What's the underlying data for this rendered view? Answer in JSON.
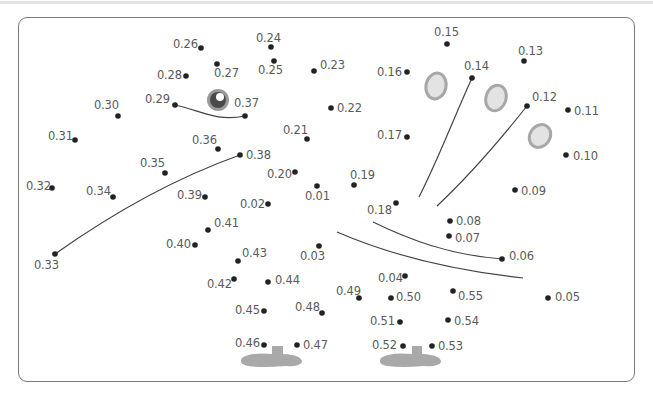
{
  "page": {
    "header_strip": "cropped-text-line"
  },
  "puzzle": {
    "type": "connect-the-dots",
    "dot_color": "#222222",
    "line_color": "#444444",
    "shape_fill": "#a9a9a9",
    "eye_color": "#6b6b6b",
    "oval_fill": "#e3e3e3",
    "oval_stroke": "#a8a8a8",
    "points": [
      {
        "label": "0.01",
        "x": 317,
        "y": 186,
        "lx": 305,
        "ly": 191
      },
      {
        "label": "0.02",
        "x": 268,
        "y": 204,
        "lx": 240,
        "ly": 199
      },
      {
        "label": "0.03",
        "x": 319,
        "y": 246,
        "lx": 300,
        "ly": 251
      },
      {
        "label": "0.04",
        "x": 405,
        "y": 276,
        "lx": 378,
        "ly": 273
      },
      {
        "label": "0.05",
        "x": 548,
        "y": 298,
        "lx": 555,
        "ly": 292
      },
      {
        "label": "0.06",
        "x": 502,
        "y": 259,
        "lx": 509,
        "ly": 251
      },
      {
        "label": "0.07",
        "x": 449,
        "y": 236,
        "lx": 455,
        "ly": 233
      },
      {
        "label": "0.08",
        "x": 450,
        "y": 221,
        "lx": 456,
        "ly": 216
      },
      {
        "label": "0.09",
        "x": 515,
        "y": 190,
        "lx": 521,
        "ly": 186
      },
      {
        "label": "0.10",
        "x": 566,
        "y": 155,
        "lx": 573,
        "ly": 151
      },
      {
        "label": "0.11",
        "x": 568,
        "y": 110,
        "lx": 574,
        "ly": 106
      },
      {
        "label": "0.12",
        "x": 527,
        "y": 106,
        "lx": 532,
        "ly": 92
      },
      {
        "label": "0.13",
        "x": 524,
        "y": 61,
        "lx": 518,
        "ly": 46
      },
      {
        "label": "0.14",
        "x": 472,
        "y": 78,
        "lx": 464,
        "ly": 61
      },
      {
        "label": "0.15",
        "x": 447,
        "y": 44,
        "lx": 434,
        "ly": 27
      },
      {
        "label": "0.16",
        "x": 407,
        "y": 72,
        "lx": 377,
        "ly": 67
      },
      {
        "label": "0.17",
        "x": 407,
        "y": 137,
        "lx": 377,
        "ly": 130
      },
      {
        "label": "0.18",
        "x": 396,
        "y": 203,
        "lx": 367,
        "ly": 205
      },
      {
        "label": "0.19",
        "x": 354,
        "y": 185,
        "lx": 350,
        "ly": 170
      },
      {
        "label": "0.20",
        "x": 295,
        "y": 172,
        "lx": 267,
        "ly": 169
      },
      {
        "label": "0.21",
        "x": 307,
        "y": 139,
        "lx": 283,
        "ly": 125
      },
      {
        "label": "0.22",
        "x": 331,
        "y": 108,
        "lx": 337,
        "ly": 103
      },
      {
        "label": "0.23",
        "x": 314,
        "y": 71,
        "lx": 320,
        "ly": 60
      },
      {
        "label": "0.24",
        "x": 271,
        "y": 47,
        "lx": 256,
        "ly": 33
      },
      {
        "label": "0.25",
        "x": 274,
        "y": 61,
        "lx": 258,
        "ly": 65
      },
      {
        "label": "0.26",
        "x": 201,
        "y": 48,
        "lx": 173,
        "ly": 39
      },
      {
        "label": "0.27",
        "x": 217,
        "y": 64,
        "lx": 214,
        "ly": 68
      },
      {
        "label": "0.28",
        "x": 186,
        "y": 76,
        "lx": 157,
        "ly": 70
      },
      {
        "label": "0.29",
        "x": 175,
        "y": 105,
        "lx": 145,
        "ly": 94
      },
      {
        "label": "0.30",
        "x": 118,
        "y": 116,
        "lx": 94,
        "ly": 100
      },
      {
        "label": "0.31",
        "x": 75,
        "y": 140,
        "lx": 48,
        "ly": 131
      },
      {
        "label": "0.32",
        "x": 52,
        "y": 188,
        "lx": 26,
        "ly": 181
      },
      {
        "label": "0.33",
        "x": 55,
        "y": 254,
        "lx": 34,
        "ly": 260
      },
      {
        "label": "0.34",
        "x": 113,
        "y": 197,
        "lx": 86,
        "ly": 186
      },
      {
        "label": "0.35",
        "x": 165,
        "y": 173,
        "lx": 140,
        "ly": 158
      },
      {
        "label": "0.36",
        "x": 218,
        "y": 149,
        "lx": 192,
        "ly": 135
      },
      {
        "label": "0.37",
        "x": 245,
        "y": 116,
        "lx": 234,
        "ly": 98
      },
      {
        "label": "0.38",
        "x": 240,
        "y": 155,
        "lx": 246,
        "ly": 150
      },
      {
        "label": "0.39",
        "x": 205,
        "y": 197,
        "lx": 177,
        "ly": 190
      },
      {
        "label": "0.40",
        "x": 195,
        "y": 245,
        "lx": 166,
        "ly": 239
      },
      {
        "label": "0.41",
        "x": 208,
        "y": 230,
        "lx": 214,
        "ly": 218
      },
      {
        "label": "0.42",
        "x": 234,
        "y": 279,
        "lx": 207,
        "ly": 279
      },
      {
        "label": "0.43",
        "x": 238,
        "y": 261,
        "lx": 242,
        "ly": 248
      },
      {
        "label": "0.44",
        "x": 268,
        "y": 282,
        "lx": 275,
        "ly": 275
      },
      {
        "label": "0.45",
        "x": 264,
        "y": 311,
        "lx": 235,
        "ly": 305
      },
      {
        "label": "0.46",
        "x": 264,
        "y": 345,
        "lx": 235,
        "ly": 338
      },
      {
        "label": "0.47",
        "x": 297,
        "y": 345,
        "lx": 303,
        "ly": 340
      },
      {
        "label": "0.48",
        "x": 322,
        "y": 313,
        "lx": 295,
        "ly": 302
      },
      {
        "label": "0.49",
        "x": 359,
        "y": 298,
        "lx": 336,
        "ly": 286
      },
      {
        "label": "0.50",
        "x": 391,
        "y": 298,
        "lx": 396,
        "ly": 292
      },
      {
        "label": "0.51",
        "x": 400,
        "y": 322,
        "lx": 370,
        "ly": 316
      },
      {
        "label": "0.52",
        "x": 403,
        "y": 346,
        "lx": 372,
        "ly": 340
      },
      {
        "label": "0.53",
        "x": 432,
        "y": 346,
        "lx": 438,
        "ly": 341
      },
      {
        "label": "0.54",
        "x": 448,
        "y": 320,
        "lx": 454,
        "ly": 316
      },
      {
        "label": "0.55",
        "x": 453,
        "y": 291,
        "lx": 458,
        "ly": 291
      }
    ]
  }
}
